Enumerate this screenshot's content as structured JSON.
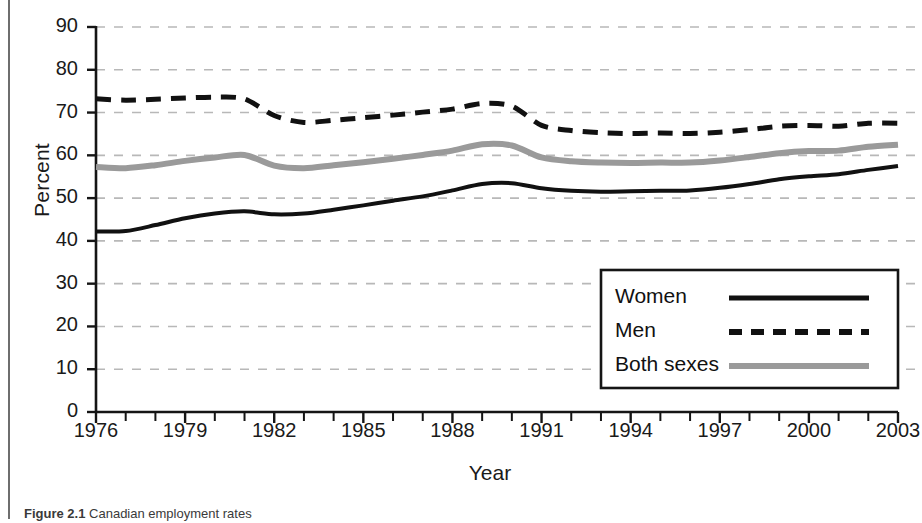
{
  "figure": {
    "caption_label": "Figure 2.1",
    "caption_text": "Canadian employment rates"
  },
  "chart_data": {
    "type": "line",
    "title": "",
    "xlabel": "Year",
    "ylabel": "Percent",
    "xlim": [
      1976,
      2003
    ],
    "ylim": [
      0,
      90
    ],
    "grid": true,
    "grid_style": "dashed-horizontal",
    "legend_position": "bottom-right",
    "x_tick_labels": [
      "1976",
      "1979",
      "1982",
      "1985",
      "1988",
      "1991",
      "1994",
      "1997",
      "2000",
      "2003"
    ],
    "x_tick_values": [
      1976,
      1979,
      1982,
      1985,
      1988,
      1991,
      1994,
      1997,
      2000,
      2003
    ],
    "x_minor_tick_interval": 1,
    "y_tick_labels": [
      "0",
      "10",
      "20",
      "30",
      "40",
      "50",
      "60",
      "70",
      "80",
      "90"
    ],
    "y_tick_values": [
      0,
      10,
      20,
      30,
      40,
      50,
      60,
      70,
      80,
      90
    ],
    "x": [
      1976,
      1977,
      1978,
      1979,
      1980,
      1981,
      1982,
      1983,
      1984,
      1985,
      1986,
      1987,
      1988,
      1989,
      1990,
      1991,
      1992,
      1993,
      1994,
      1995,
      1996,
      1997,
      1998,
      1999,
      2000,
      2001,
      2002,
      2003
    ],
    "series": [
      {
        "name": "Women",
        "color": "#111111",
        "style": "solid",
        "width": 4,
        "values": [
          42.2,
          42.3,
          43.7,
          45.3,
          46.4,
          46.9,
          46.2,
          46.4,
          47.3,
          48.3,
          49.4,
          50.4,
          51.8,
          53.3,
          53.5,
          52.3,
          51.7,
          51.5,
          51.6,
          51.7,
          51.8,
          52.4,
          53.3,
          54.4,
          55.1,
          55.6,
          56.6,
          57.5
        ]
      },
      {
        "name": "Men",
        "color": "#111111",
        "style": "dashed",
        "width": 5,
        "values": [
          73.2,
          72.9,
          73.1,
          73.4,
          73.6,
          73.2,
          69.3,
          67.7,
          68.2,
          68.8,
          69.4,
          70.1,
          70.8,
          72.1,
          71.5,
          67.0,
          65.8,
          65.3,
          65.1,
          65.2,
          65.1,
          65.4,
          66.0,
          66.8,
          67.0,
          66.8,
          67.5,
          67.5
        ]
      },
      {
        "name": "Both sexes",
        "color": "#9a9a9a",
        "style": "solid",
        "width": 6,
        "values": [
          57.3,
          57.0,
          57.7,
          58.7,
          59.5,
          60.1,
          57.6,
          57.0,
          57.7,
          58.4,
          59.2,
          60.1,
          61.1,
          62.6,
          62.3,
          59.5,
          58.6,
          58.3,
          58.2,
          58.3,
          58.3,
          58.8,
          59.6,
          60.5,
          61.0,
          61.1,
          62.0,
          62.5
        ]
      }
    ],
    "legend": [
      {
        "label": "Women",
        "color": "#111111",
        "style": "solid"
      },
      {
        "label": "Men",
        "color": "#111111",
        "style": "dashed"
      },
      {
        "label": "Both sexes",
        "color": "#9a9a9a",
        "style": "solid"
      }
    ]
  }
}
